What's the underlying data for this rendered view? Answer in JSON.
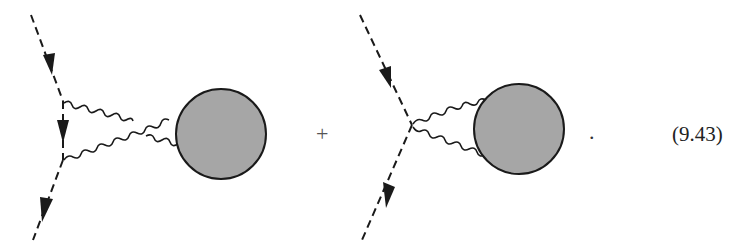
{
  "equation": {
    "number_label": "(9.43)",
    "operator": "+",
    "terminator": "."
  },
  "diagrams": [
    {
      "name": "crossed-photon-exchange",
      "external_lines": "dashed scalar lines with arrows",
      "internal_lines": "two crossed wavy photon lines",
      "blob": "shaded circle"
    },
    {
      "name": "seagull-photon-loop",
      "external_lines": "dashed scalar lines with arrows",
      "internal_lines": "two wavy photon lines from single vertex",
      "blob": "shaded circle"
    }
  ],
  "colors": {
    "line": "#1a1a1a",
    "blob_fill": "#a6a6a6"
  }
}
